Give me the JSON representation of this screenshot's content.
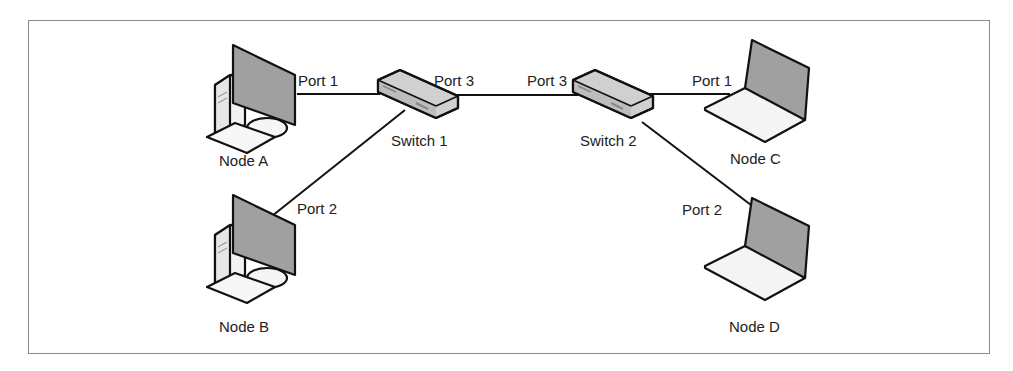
{
  "diagram": {
    "type": "network-topology",
    "nodes": [
      {
        "id": "node-a",
        "label": "Node A",
        "kind": "desktop"
      },
      {
        "id": "node-b",
        "label": "Node B",
        "kind": "desktop"
      },
      {
        "id": "node-c",
        "label": "Node C",
        "kind": "laptop"
      },
      {
        "id": "node-d",
        "label": "Node D",
        "kind": "laptop"
      },
      {
        "id": "switch-1",
        "label": "Switch 1",
        "kind": "switch"
      },
      {
        "id": "switch-2",
        "label": "Switch 2",
        "kind": "switch"
      }
    ],
    "links": [
      {
        "from": "node-a",
        "to": "switch-1",
        "port_label": "Port 1"
      },
      {
        "from": "node-b",
        "to": "switch-1",
        "port_label": "Port 2"
      },
      {
        "from": "switch-1",
        "to": "switch-2",
        "port_label_from": "Port 3",
        "port_label_to": "Port 3"
      },
      {
        "from": "switch-2",
        "to": "node-c",
        "port_label": "Port 1"
      },
      {
        "from": "switch-2",
        "to": "node-d",
        "port_label": "Port 2"
      }
    ],
    "labels": {
      "node_a": "Node A",
      "node_b": "Node B",
      "node_c": "Node C",
      "node_d": "Node D",
      "switch_1": "Switch 1",
      "switch_2": "Switch 2",
      "sw1_port1": "Port 1",
      "sw1_port2": "Port 2",
      "sw1_port3": "Port 3",
      "sw2_port3": "Port 3",
      "sw2_port1": "Port 1",
      "sw2_port2": "Port 2"
    },
    "colors": {
      "border": "#8a8a8a",
      "line": "#111111",
      "screen": "#9a9a9a",
      "device_fill": "#f2f2f2",
      "switch_fill": "#c8c8c8"
    }
  }
}
